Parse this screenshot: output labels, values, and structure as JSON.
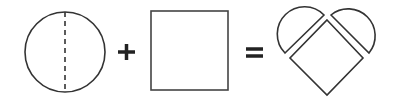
{
  "diagram": {
    "stroke_color": "#333333",
    "operators": {
      "plus": "+",
      "equals": "="
    },
    "shapes": [
      {
        "name": "circle",
        "note": "dashed vertical line splits circle in half"
      },
      {
        "name": "square"
      },
      {
        "name": "heart",
        "note": "two semicircles attached to the top sides of a diamond (rotated square)"
      }
    ]
  }
}
